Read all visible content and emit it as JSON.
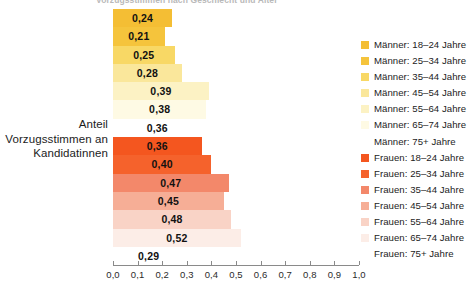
{
  "title": {
    "clipped_text": "Vorzugsstimmen nach Geschlecht und Alter"
  },
  "axis_label": {
    "line1": "Anteil",
    "line2": "Vorzugsstimmen an",
    "line3": "Kandidatinnen"
  },
  "colors": {
    "maenner_18_24": "#F4BE34",
    "maenner_25_34": "#F5C43C",
    "maenner_35_44": "#F8D865",
    "maenner_45_54": "#FAE79B",
    "maenner_55_64": "#FCF2C4",
    "maenner_65_74": "#FEFAE4",
    "maenner_75plus": "#FFFFFF",
    "frauen_18_24": "#F4561F",
    "frauen_25_34": "#F5622C",
    "frauen_35_44": "#F3886A",
    "frauen_45_54": "#F6AE96",
    "frauen_55_64": "#F9D3C6",
    "frauen_65_74": "#FCEDE7",
    "frauen_75plus": "#FFFFFF",
    "axis": "#8A8A8A",
    "text": "#1C1C1C"
  },
  "chart_data": {
    "type": "bar",
    "orientation": "horizontal",
    "title": "Vorzugsstimmen nach Geschlecht und Alter",
    "xlabel": "",
    "ylabel": "Anteil Vorzugsstimmen an Kandidatinnen",
    "xlim": [
      0,
      1.0
    ],
    "grid": false,
    "legend_position": "right",
    "tick_labels": [
      "0,0",
      "0,1",
      "0,2",
      "0,3",
      "0,4",
      "0,5",
      "0,6",
      "0,7",
      "0,8",
      "0,9",
      "1,0"
    ],
    "tick_values": [
      0.0,
      0.1,
      0.2,
      0.3,
      0.4,
      0.5,
      0.6,
      0.7,
      0.8,
      0.9,
      1.0
    ],
    "categories": [
      "Männer: 18–24 Jahre",
      "Männer: 25–34 Jahre",
      "Männer: 35–44 Jahre",
      "Männer: 45–54 Jahre",
      "Männer: 55–64 Jahre",
      "Männer: 65–74 Jahre",
      "Männer: 75+ Jahre",
      "Frauen: 18–24 Jahre",
      "Frauen: 25–34 Jahre",
      "Frauen: 35–44 Jahre",
      "Frauen: 45–54 Jahre",
      "Frauen: 55–64 Jahre",
      "Frauen: 65–74 Jahre",
      "Frauen: 75+ Jahre"
    ],
    "values": [
      0.24,
      0.21,
      0.25,
      0.28,
      0.39,
      0.38,
      0.36,
      0.36,
      0.4,
      0.47,
      0.45,
      0.48,
      0.52,
      0.29
    ],
    "value_labels": [
      "0,24",
      "0,21",
      "0,25",
      "0,28",
      "0,39",
      "0,38",
      "0,36",
      "0,36",
      "0,40",
      "0,47",
      "0,45",
      "0,48",
      "0,52",
      "0,29"
    ]
  },
  "bars": [
    {
      "label": "0,24",
      "value": 0.24,
      "color": "#F4BE34",
      "name": "bar-maenner-18-24"
    },
    {
      "label": "0,21",
      "value": 0.21,
      "color": "#F5C43C",
      "name": "bar-maenner-25-34"
    },
    {
      "label": "0,25",
      "value": 0.25,
      "color": "#F8D865",
      "name": "bar-maenner-35-44"
    },
    {
      "label": "0,28",
      "value": 0.28,
      "color": "#FAE79B",
      "name": "bar-maenner-45-54"
    },
    {
      "label": "0,39",
      "value": 0.39,
      "color": "#FCF2C4",
      "name": "bar-maenner-55-64"
    },
    {
      "label": "0,38",
      "value": 0.38,
      "color": "#FEFAE4",
      "name": "bar-maenner-65-74"
    },
    {
      "label": "0,36",
      "value": 0.36,
      "color": "#FFFFFF",
      "name": "bar-maenner-75plus"
    },
    {
      "label": "0,36",
      "value": 0.36,
      "color": "#F4561F",
      "name": "bar-frauen-18-24"
    },
    {
      "label": "0,40",
      "value": 0.4,
      "color": "#F5622C",
      "name": "bar-frauen-25-34"
    },
    {
      "label": "0,47",
      "value": 0.47,
      "color": "#F3886A",
      "name": "bar-frauen-35-44"
    },
    {
      "label": "0,45",
      "value": 0.45,
      "color": "#F6AE96",
      "name": "bar-frauen-45-54"
    },
    {
      "label": "0,48",
      "value": 0.48,
      "color": "#F9D3C6",
      "name": "bar-frauen-55-64"
    },
    {
      "label": "0,52",
      "value": 0.52,
      "color": "#FCEDE7",
      "name": "bar-frauen-65-74"
    },
    {
      "label": "0,29",
      "value": 0.29,
      "color": "#FFFFFF",
      "name": "bar-frauen-75plus"
    }
  ],
  "legend": {
    "items": [
      {
        "label": "Männer: 18–24 Jahre",
        "color": "#F4BE34"
      },
      {
        "label": "Männer: 25–34 Jahre",
        "color": "#F5C43C"
      },
      {
        "label": "Männer: 35–44 Jahre",
        "color": "#F8D865"
      },
      {
        "label": "Männer: 45–54 Jahre",
        "color": "#FAE79B"
      },
      {
        "label": "Männer: 55–64 Jahre",
        "color": "#FCF2C4"
      },
      {
        "label": "Männer: 65–74 Jahre",
        "color": "#FEFAE4"
      },
      {
        "label": "Männer: 75+ Jahre",
        "color": "#FFFFFF"
      },
      {
        "label": "Frauen: 18–24 Jahre",
        "color": "#F4561F"
      },
      {
        "label": "Frauen: 25–34 Jahre",
        "color": "#F5622C"
      },
      {
        "label": "Frauen: 35–44 Jahre",
        "color": "#F3886A"
      },
      {
        "label": "Frauen: 45–54 Jahre",
        "color": "#F6AE96"
      },
      {
        "label": "Frauen: 55–64 Jahre",
        "color": "#F9D3C6"
      },
      {
        "label": "Frauen: 65–74 Jahre",
        "color": "#FCEDE7"
      },
      {
        "label": "Frauen: 75+ Jahre",
        "color": "#FFFFFF"
      }
    ]
  },
  "xaxis": {
    "ticks": [
      {
        "label": "0,0",
        "value": 0.0
      },
      {
        "label": "0,1",
        "value": 0.1
      },
      {
        "label": "0,2",
        "value": 0.2
      },
      {
        "label": "0,3",
        "value": 0.3
      },
      {
        "label": "0,4",
        "value": 0.4
      },
      {
        "label": "0,5",
        "value": 0.5
      },
      {
        "label": "0,6",
        "value": 0.6
      },
      {
        "label": "0,7",
        "value": 0.7
      },
      {
        "label": "0,8",
        "value": 0.8
      },
      {
        "label": "0,9",
        "value": 0.9
      },
      {
        "label": "1,0",
        "value": 1.0
      }
    ]
  }
}
